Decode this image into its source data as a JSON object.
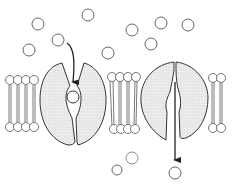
{
  "diagram": {
    "title": "Carrier protein transport across a lipid bilayer",
    "colors": {
      "stroke": "#3a3a3a",
      "protein_fill": "#e6e6e6",
      "background": "#ffffff",
      "arrow": "#222222"
    },
    "membrane": {
      "label": "phospholipid bilayer",
      "outer_head_y": 80,
      "inner_head_y": 127,
      "segments": [
        {
          "name": "left",
          "x_start": 6,
          "x_end": 40
        },
        {
          "name": "middle",
          "x_start": 108,
          "x_end": 142
        },
        {
          "name": "right",
          "x_start": 210,
          "x_end": 230
        }
      ]
    },
    "proteins": [
      {
        "name": "carrier-protein-binding",
        "state": "open to outside, solute bound",
        "arrow": "into protein"
      },
      {
        "name": "carrier-protein-releasing",
        "state": "open to inside, solute released",
        "arrow": "out of protein downward"
      }
    ],
    "solutes": {
      "outside": [
        [
          38,
          24
        ],
        [
          58,
          42
        ],
        [
          29,
          50
        ],
        [
          88,
          15
        ],
        [
          108,
          52
        ],
        [
          135,
          26
        ],
        [
          151,
          44
        ],
        [
          161,
          23
        ],
        [
          188,
          23
        ]
      ],
      "bound": [
        [
          73,
          96
        ]
      ],
      "inside": [
        [
          134,
          160
        ],
        [
          175,
          172
        ],
        [
          118,
          167
        ]
      ]
    }
  }
}
